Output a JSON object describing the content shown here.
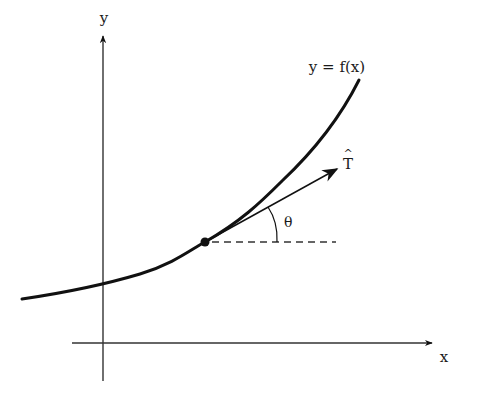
{
  "diagram": {
    "type": "unit-tangent-vector-figure",
    "colors": {
      "stroke": "#111111",
      "axis": "#333333",
      "background": "#ffffff"
    },
    "axes": {
      "x_label": "x",
      "y_label": "y"
    },
    "curve": {
      "label": "y = f(x)"
    },
    "tangent_vector": {
      "label": "T",
      "hat": "^"
    },
    "angle": {
      "label": "θ"
    }
  }
}
